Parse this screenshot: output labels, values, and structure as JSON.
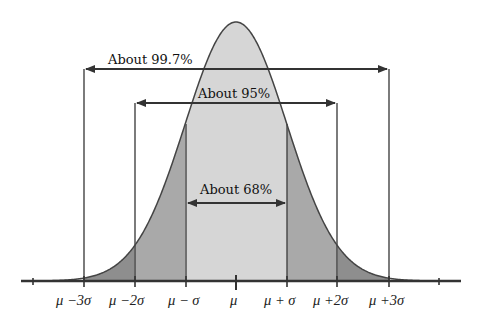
{
  "diagram": {
    "type": "normal-distribution",
    "colors": {
      "background": "#ffffff",
      "center_band": "#d6d6d6",
      "one_to_two_sigma_band": "#a9a9a9",
      "two_to_three_sigma_band": "#8e8e8e",
      "line": "#333333"
    },
    "ranges": [
      {
        "label": "About 68%",
        "from_sigma": -1,
        "to_sigma": 1
      },
      {
        "label": "About 95%",
        "from_sigma": -2,
        "to_sigma": 2
      },
      {
        "label": "About 99.7%",
        "from_sigma": -3,
        "to_sigma": 3
      }
    ],
    "axis_labels": [
      {
        "sigma": -3,
        "label": "μ −3σ"
      },
      {
        "sigma": -2,
        "label": "μ −2σ"
      },
      {
        "sigma": -1,
        "label": "μ − σ"
      },
      {
        "sigma": 0,
        "label": "μ"
      },
      {
        "sigma": 1,
        "label": "μ + σ"
      },
      {
        "sigma": 2,
        "label": "μ +2σ"
      },
      {
        "sigma": 3,
        "label": "μ +3σ"
      }
    ]
  },
  "chart_data": {
    "type": "area",
    "title": "",
    "xlabel": "",
    "ylabel": "",
    "categories": [
      "μ −3σ",
      "μ −2σ",
      "μ − σ",
      "μ",
      "μ + σ",
      "μ +2σ",
      "μ +3σ"
    ],
    "x": [
      -3,
      -2,
      -1,
      0,
      1,
      2,
      3
    ],
    "series": [
      {
        "name": "Normal density (relative height)",
        "values": [
          0.011,
          0.135,
          0.607,
          1.0,
          0.607,
          0.135,
          0.011
        ]
      }
    ],
    "annotations": [
      {
        "text": "About 68%",
        "range": [
          -1,
          1
        ]
      },
      {
        "text": "About 95%",
        "range": [
          -2,
          2
        ]
      },
      {
        "text": "About 99.7%",
        "range": [
          -3,
          3
        ]
      }
    ],
    "xlim": [
      -4,
      4
    ],
    "grid": false,
    "legend": "none"
  }
}
